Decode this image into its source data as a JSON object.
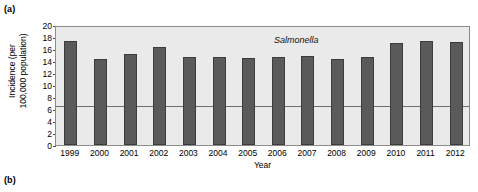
{
  "panels": {
    "a_label": "(a)",
    "b_label": "(b)"
  },
  "chart_data": {
    "type": "bar",
    "title": "",
    "annotation": "Salmonella",
    "xlabel": "Year",
    "ylabel_line1": "Incidence (per",
    "ylabel_line2": "100,000 population)",
    "categories": [
      "1999",
      "2000",
      "2001",
      "2002",
      "2003",
      "2004",
      "2005",
      "2006",
      "2007",
      "2008",
      "2009",
      "2010",
      "2011",
      "2012"
    ],
    "values": [
      17.4,
      14.3,
      15.2,
      16.3,
      14.6,
      14.7,
      14.5,
      14.6,
      14.9,
      14.4,
      14.6,
      17.0,
      17.3,
      17.1
    ],
    "ylim": [
      0,
      20
    ],
    "yticks": [
      0,
      2,
      4,
      6,
      8,
      10,
      12,
      14,
      16,
      18,
      20
    ],
    "reference_line": 6.8,
    "grid": false,
    "legend": "none",
    "bar_color": "#5a5a5a",
    "bar_edge_color": "#3c3c3c",
    "plot_background": "#eaeaea",
    "reference_line_color": "#6e6e6e"
  }
}
